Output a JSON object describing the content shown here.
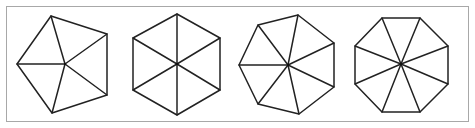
{
  "figure": {
    "border_color": "#a8a8a8",
    "line_color": "#222222",
    "shapes": [
      {
        "name": "pentagon",
        "sides": 5,
        "center": [
          65,
          64
        ],
        "vertices": [
          [
            51,
            16
          ],
          [
            107,
            34
          ],
          [
            107,
            95
          ],
          [
            52,
            113
          ],
          [
            17,
            64
          ]
        ]
      },
      {
        "name": "hexagon",
        "sides": 6,
        "center": [
          177,
          64
        ],
        "vertices": [
          [
            177,
            14
          ],
          [
            220,
            38
          ],
          [
            220,
            90
          ],
          [
            177,
            115
          ],
          [
            133,
            90
          ],
          [
            133,
            38
          ]
        ]
      },
      {
        "name": "heptagon",
        "sides": 7,
        "center": [
          288,
          65
        ],
        "vertices": [
          [
            298,
            15
          ],
          [
            334,
            43
          ],
          [
            334,
            87
          ],
          [
            299,
            114
          ],
          [
            258,
            104
          ],
          [
            239,
            65
          ],
          [
            258,
            25
          ]
        ]
      },
      {
        "name": "octagon",
        "sides": 8,
        "center": [
          401,
          64
        ],
        "vertices": [
          [
            382,
            18
          ],
          [
            420,
            18
          ],
          [
            448,
            46
          ],
          [
            448,
            84
          ],
          [
            420,
            112
          ],
          [
            382,
            112
          ],
          [
            355,
            84
          ],
          [
            355,
            46
          ]
        ]
      }
    ]
  }
}
